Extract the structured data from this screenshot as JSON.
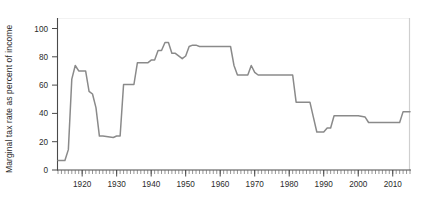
{
  "chart_data": {
    "type": "line",
    "title": "",
    "xlabel": "",
    "ylabel": "Marginal tax rate as percent of income",
    "xlim": [
      1913,
      2015
    ],
    "ylim": [
      0,
      112
    ],
    "yticks": [
      0,
      20,
      40,
      60,
      80,
      100
    ],
    "ytick_labels": [
      "0",
      "20",
      "40",
      "60",
      "80",
      "100"
    ],
    "xticks": [
      1920,
      1930,
      1940,
      1950,
      1960,
      1970,
      1980,
      1990,
      2000,
      2010
    ],
    "xtick_labels": [
      "1920",
      "1930",
      "1940",
      "1950",
      "1960",
      "1970",
      "1980",
      "1990",
      "2000",
      "2010"
    ],
    "x_minor_tick_interval": 1,
    "grid": false,
    "legend": null,
    "series": [
      {
        "name": "Top marginal tax rate",
        "color": "#8a8a8a",
        "x": [
          1913,
          1915,
          1916,
          1917,
          1918,
          1919,
          1920,
          1921,
          1922,
          1923,
          1924,
          1925,
          1926,
          1929,
          1930,
          1931,
          1932,
          1933,
          1935,
          1936,
          1939,
          1940,
          1941,
          1942,
          1943,
          1944,
          1945,
          1946,
          1947,
          1949,
          1950,
          1951,
          1952,
          1953,
          1954,
          1963,
          1964,
          1965,
          1968,
          1969,
          1970,
          1971,
          1981,
          1982,
          1986,
          1987,
          1988,
          1990,
          1991,
          1992,
          1993,
          2000,
          2002,
          2003,
          2012,
          2013,
          2015
        ],
        "values": [
          7,
          7,
          15,
          67,
          77,
          73,
          73,
          73,
          58,
          56,
          46,
          25,
          25,
          24,
          25,
          25,
          63,
          63,
          63,
          79,
          79,
          81,
          81,
          88,
          88,
          94,
          94,
          86,
          86,
          82,
          84,
          91,
          92,
          92,
          91,
          91,
          77,
          70,
          70,
          77,
          72,
          70,
          70,
          50,
          50,
          39,
          28,
          28,
          31,
          31,
          40,
          40,
          39,
          35,
          35,
          43,
          43
        ]
      }
    ]
  },
  "axes": {
    "ylabel": "Marginal tax rate as percent of income"
  }
}
